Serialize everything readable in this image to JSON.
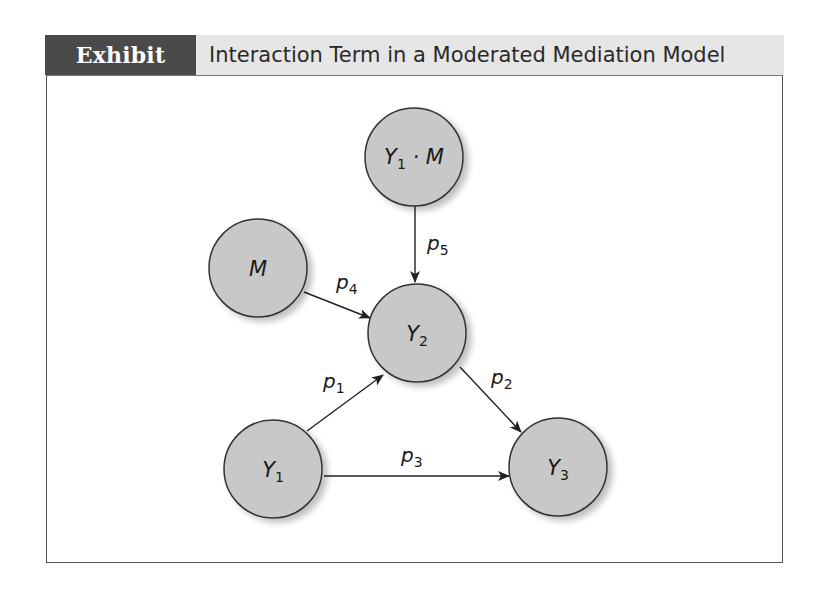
{
  "header": {
    "exhibit_label": "Exhibit 7.20",
    "title": "Interaction Term in a Moderated Mediation Model"
  },
  "colors": {
    "label_background": "#4a4a4a",
    "header_background": "#e6e6e6",
    "node_fill": "#c8c8c8",
    "node_stroke": "#333333",
    "arrow": "#222222"
  },
  "nodes": [
    {
      "id": "Y1M",
      "label": "Y",
      "subscript": "1",
      "suffix": " · M"
    },
    {
      "id": "M",
      "label": "M",
      "subscript": "",
      "suffix": ""
    },
    {
      "id": "Y2",
      "label": "Y",
      "subscript": "2",
      "suffix": ""
    },
    {
      "id": "Y1",
      "label": "Y",
      "subscript": "1",
      "suffix": ""
    },
    {
      "id": "Y3",
      "label": "Y",
      "subscript": "3",
      "suffix": ""
    }
  ],
  "edges": [
    {
      "from": "Y1",
      "to": "Y2",
      "label": "p",
      "subscript": "1"
    },
    {
      "from": "Y2",
      "to": "Y3",
      "label": "p",
      "subscript": "2"
    },
    {
      "from": "Y1",
      "to": "Y3",
      "label": "p",
      "subscript": "3"
    },
    {
      "from": "M",
      "to": "Y2",
      "label": "p",
      "subscript": "4"
    },
    {
      "from": "Y1M",
      "to": "Y2",
      "label": "p",
      "subscript": "5"
    }
  ]
}
